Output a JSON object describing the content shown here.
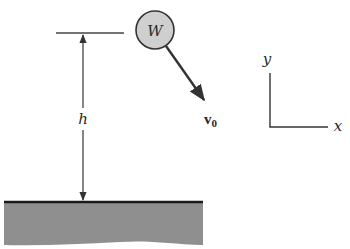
{
  "diagram": {
    "ball": {
      "label": "W",
      "fill": "#cfcfcf",
      "stroke": "#333333"
    },
    "velocity": {
      "label": "v",
      "subscript": "0"
    },
    "height": {
      "label": "h"
    },
    "axes": {
      "x_label": "x",
      "y_label": "y"
    },
    "ground": {
      "fill": "#8f8f8f",
      "surface": "#1a1a1a"
    }
  }
}
